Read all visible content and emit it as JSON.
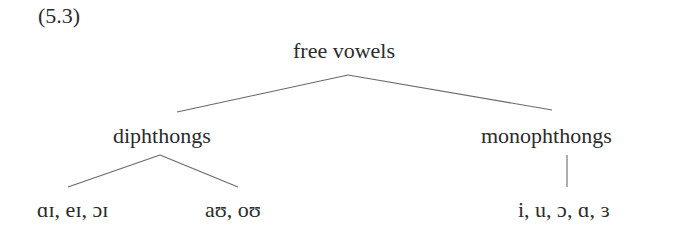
{
  "example_number": "(5.3)",
  "tree": {
    "root": {
      "label": "free vowels"
    },
    "children": [
      {
        "label": "diphthongs",
        "leaves": [
          "ɑɪ, eɪ, ɔɪ",
          "aʊ, oʊ"
        ]
      },
      {
        "label": "monophthongs",
        "leaves": [
          "i, u, ɔ, ɑ, ɜ"
        ]
      }
    ]
  },
  "colors": {
    "text": "#2b2b2b",
    "lines": "#6a6a6a",
    "background": "#ffffff"
  }
}
